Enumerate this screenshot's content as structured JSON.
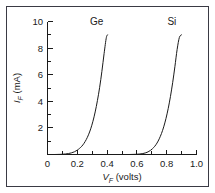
{
  "figure": {
    "background_color": "#ffffff",
    "frame_color": "#3a3a44",
    "ink_color": "#1a1a1a"
  },
  "chart_data": {
    "type": "line",
    "title": "",
    "xlabel": "V_F (volts)",
    "xlabel_symbol": "V",
    "xlabel_subscript": "F",
    "xlabel_units": "(volts)",
    "ylabel": "I_F (mA)",
    "ylabel_symbol": "I",
    "ylabel_subscript": "F",
    "ylabel_units": "(mA)",
    "xlim": [
      0,
      1.0
    ],
    "ylim": [
      0,
      10
    ],
    "grid": false,
    "legend_position": "inline-at-curve-top",
    "x_ticks_major": [
      "0",
      "0.2",
      "0.4",
      "0.6",
      "0.8",
      "1.0"
    ],
    "x_ticks_major_values": [
      0,
      0.2,
      0.4,
      0.6,
      0.8,
      1.0
    ],
    "x_ticks_minor_values": [
      0.1,
      0.3,
      0.5,
      0.7,
      0.9
    ],
    "y_ticks_major": [
      "2",
      "4",
      "6",
      "8",
      "10"
    ],
    "y_ticks_major_values": [
      2,
      4,
      6,
      8,
      10
    ],
    "y_ticks_minor_values": [
      1,
      3,
      5,
      7,
      9
    ],
    "series": [
      {
        "name": "Ge",
        "label": "Ge",
        "label_x": 0.33,
        "label_y": 9.75,
        "knee_voltage": 0.2,
        "x": [
          0.05,
          0.08,
          0.1,
          0.12,
          0.14,
          0.16,
          0.18,
          0.2,
          0.215,
          0.23,
          0.245,
          0.26,
          0.275,
          0.29,
          0.305,
          0.32,
          0.335,
          0.35,
          0.365,
          0.38,
          0.395,
          0.405
        ],
        "y": [
          0.0,
          0.01,
          0.02,
          0.04,
          0.07,
          0.12,
          0.2,
          0.33,
          0.46,
          0.62,
          0.84,
          1.12,
          1.48,
          1.93,
          2.5,
          3.2,
          4.05,
          5.05,
          6.25,
          7.6,
          8.8,
          9.0
        ]
      },
      {
        "name": "Si",
        "label": "Si",
        "label_x": 0.835,
        "label_y": 9.75,
        "knee_voltage": 0.7,
        "x": [
          0.55,
          0.58,
          0.6,
          0.62,
          0.64,
          0.66,
          0.675,
          0.69,
          0.705,
          0.72,
          0.735,
          0.75,
          0.765,
          0.78,
          0.795,
          0.81,
          0.825,
          0.84,
          0.855,
          0.87,
          0.885,
          0.9
        ],
        "y": [
          0.0,
          0.01,
          0.02,
          0.04,
          0.07,
          0.13,
          0.2,
          0.3,
          0.44,
          0.62,
          0.86,
          1.18,
          1.58,
          2.08,
          2.7,
          3.45,
          4.35,
          5.4,
          6.6,
          7.9,
          8.8,
          9.0
        ]
      }
    ]
  }
}
